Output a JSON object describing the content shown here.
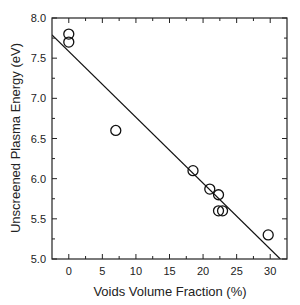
{
  "chart_data": {
    "type": "scatter",
    "title": "",
    "xlabel": "Voids Volume Fraction (%)",
    "ylabel": "Unscreened Plasma Energy (eV)",
    "xlim": [
      -2.5,
      32.5
    ],
    "ylim": [
      5.0,
      8.0
    ],
    "xticks": [
      0,
      5,
      10,
      15,
      20,
      25,
      30
    ],
    "yticks": [
      5.0,
      5.5,
      6.0,
      6.5,
      7.0,
      7.5,
      8.0
    ],
    "xtick_labels": [
      "0",
      "5",
      "10",
      "15",
      "20",
      "25",
      "30"
    ],
    "ytick_labels": [
      "5.0",
      "5.5",
      "6.0",
      "6.5",
      "7.0",
      "7.5",
      "8.0"
    ],
    "grid": false,
    "legend": null,
    "series": [
      {
        "name": "data",
        "marker": "open-circle",
        "points": [
          {
            "x": 0,
            "y": 7.8
          },
          {
            "x": 0,
            "y": 7.7
          },
          {
            "x": 7,
            "y": 6.6
          },
          {
            "x": 18.5,
            "y": 6.1
          },
          {
            "x": 21,
            "y": 5.87
          },
          {
            "x": 22.3,
            "y": 5.8
          },
          {
            "x": 22.3,
            "y": 5.6
          },
          {
            "x": 22.9,
            "y": 5.6
          },
          {
            "x": 29.7,
            "y": 5.3
          }
        ]
      },
      {
        "name": "linear fit",
        "marker": "line",
        "points": [
          {
            "x": -2.5,
            "y": 7.79
          },
          {
            "x": 31.5,
            "y": 5.0
          }
        ]
      }
    ]
  }
}
